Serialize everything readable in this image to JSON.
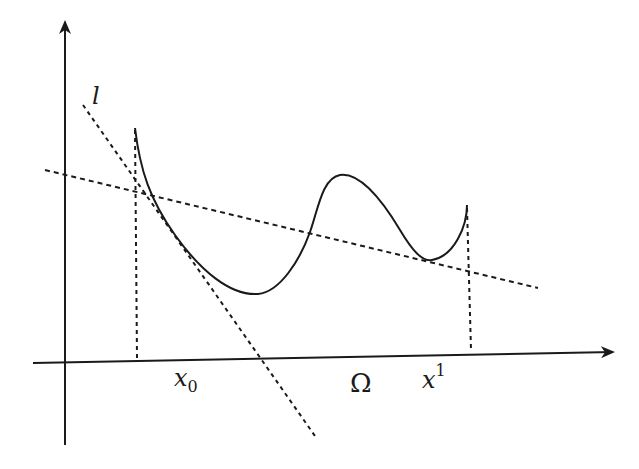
{
  "diagram": {
    "title": "",
    "labels": {
      "tangent": "l",
      "x0_base": "x",
      "x0_sub": "0",
      "omega": "Ω",
      "x1_base": "x",
      "x1_sup": "1"
    },
    "colors": {
      "ink": "#1a1a1a",
      "background": "#ffffff"
    },
    "elements": [
      "y-axis with arrow",
      "x-axis with arrow",
      "solid curve on domain Ω from x0 to x1",
      "dashed tangent line l at x0",
      "dashed secant line",
      "dashed vertical at x0",
      "dashed vertical at x1"
    ]
  }
}
